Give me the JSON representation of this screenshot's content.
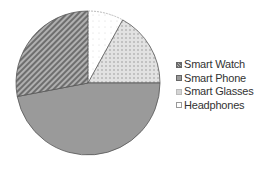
{
  "chart_data": {
    "type": "pie",
    "title": "",
    "categories": [
      "Smart Watch",
      "Smart Phone",
      "Smart Glasses",
      "Headphones"
    ],
    "values": [
      28,
      47,
      17,
      8
    ],
    "unit": "%",
    "start_angle_deg": 0,
    "direction": "clockwise",
    "slice_order_clockwise_from_top": [
      "Headphones",
      "Smart Glasses",
      "Smart Phone",
      "Smart Watch"
    ],
    "legend_position": "right",
    "styles": {
      "Smart Watch": {
        "fill": "#8c8c8c",
        "pattern": "diagonal-stripes"
      },
      "Smart Phone": {
        "fill": "#9a9a9a",
        "pattern": "solid"
      },
      "Smart Glasses": {
        "fill": "#dcdcdc",
        "pattern": "dots"
      },
      "Headphones": {
        "fill": "#ffffff",
        "pattern": "sparse-dots"
      }
    }
  },
  "legend": {
    "items": [
      {
        "label": "Smart Watch"
      },
      {
        "label": "Smart Phone"
      },
      {
        "label": "Smart Glasses"
      },
      {
        "label": "Headphones"
      }
    ]
  }
}
